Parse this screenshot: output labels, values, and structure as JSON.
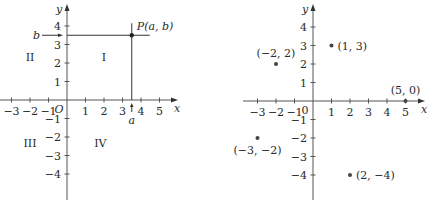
{
  "left": {
    "axis_x_label": "x",
    "axis_y_label": "y",
    "origin_label": "O",
    "x_ticks": [
      -3,
      -2,
      -1,
      1,
      2,
      3,
      4,
      5
    ],
    "y_ticks": [
      -4,
      -3,
      -2,
      -1,
      1,
      2,
      3,
      4
    ],
    "x_tick_labels": [
      "−3",
      "−2",
      "−1",
      "1",
      "2",
      "3",
      "4",
      "5"
    ],
    "y_tick_labels": [
      "−4",
      "−3",
      "−2",
      "−1",
      "1",
      "2",
      "3",
      "4"
    ],
    "quadrants": [
      {
        "label": "I",
        "x": 2,
        "y": 2.3
      },
      {
        "label": "II",
        "x": -2,
        "y": 2.3
      },
      {
        "label": "III",
        "x": -2,
        "y": -2.3
      },
      {
        "label": "IV",
        "x": 1.8,
        "y": -2.3
      }
    ],
    "point": {
      "label": "P(a, b)",
      "x": 3.5,
      "y": 3.5
    },
    "a_label": "a",
    "b_label": "b",
    "xlim": [
      -3.6,
      5.8
    ],
    "ylim": [
      -4.8,
      4.8
    ]
  },
  "right": {
    "axis_x_label": "x",
    "axis_y_label": "y",
    "origin_label": "0",
    "x_ticks": [
      -3,
      -2,
      -1,
      1,
      2,
      3,
      4,
      5
    ],
    "y_ticks": [
      -4,
      -3,
      -2,
      -1,
      1,
      2,
      3,
      4
    ],
    "x_tick_labels": [
      "−3",
      "−2",
      "−1",
      "1",
      "2",
      "3",
      "4",
      "5"
    ],
    "y_tick_labels": [
      "−4",
      "−3",
      "−2",
      "−1",
      "1",
      "2",
      "3",
      "4"
    ],
    "points": [
      {
        "label": "(1, 3)",
        "x": 1,
        "y": 3,
        "pos": "right"
      },
      {
        "label": "(−2, 2)",
        "x": -2,
        "y": 2,
        "pos": "above"
      },
      {
        "label": "(5, 0)",
        "x": 5,
        "y": 0,
        "pos": "above"
      },
      {
        "label": "(−3, −2)",
        "x": -3,
        "y": -2,
        "pos": "below"
      },
      {
        "label": "(2, −4)",
        "x": 2,
        "y": -4,
        "pos": "right"
      }
    ],
    "xlim": [
      -3.8,
      6.1
    ],
    "ylim": [
      -4.8,
      4.8
    ]
  }
}
